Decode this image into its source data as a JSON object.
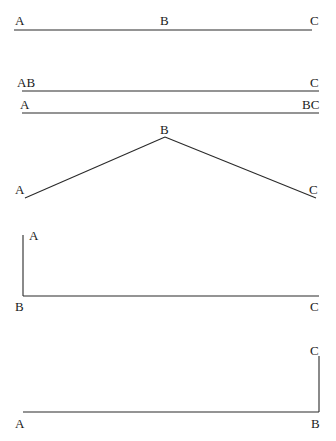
{
  "figures": [
    {
      "id": "straight-line-abc",
      "labels": [
        {
          "text": "A",
          "x": 15,
          "y": 25
        },
        {
          "text": "B",
          "x": 160,
          "y": 25
        },
        {
          "text": "C",
          "x": 310,
          "y": 25
        }
      ],
      "segments": [
        [
          14,
          30,
          312,
          30
        ]
      ]
    },
    {
      "id": "line-ab-c",
      "labels": [
        {
          "text": "AB",
          "x": 17,
          "y": 87
        },
        {
          "text": "C",
          "x": 310,
          "y": 87
        }
      ],
      "segments": [
        [
          22,
          91,
          319,
          91
        ]
      ]
    },
    {
      "id": "line-a-bc",
      "labels": [
        {
          "text": "A",
          "x": 20,
          "y": 109
        },
        {
          "text": "BC",
          "x": 302,
          "y": 109
        }
      ],
      "segments": [
        [
          22,
          113,
          319,
          113
        ]
      ]
    },
    {
      "id": "angle-peak-b",
      "labels": [
        {
          "text": "B",
          "x": 160,
          "y": 134
        },
        {
          "text": "A",
          "x": 15,
          "y": 194
        },
        {
          "text": "C",
          "x": 309,
          "y": 194
        }
      ],
      "segments": [
        [
          25,
          198,
          165,
          137
        ],
        [
          165,
          137,
          316,
          198
        ]
      ]
    },
    {
      "id": "right-angle-at-b-left",
      "labels": [
        {
          "text": "A",
          "x": 29,
          "y": 240
        },
        {
          "text": "B",
          "x": 15,
          "y": 311
        },
        {
          "text": "C",
          "x": 310,
          "y": 311
        }
      ],
      "segments": [
        [
          23,
          235,
          23,
          296
        ],
        [
          23,
          296,
          319,
          296
        ]
      ]
    },
    {
      "id": "right-angle-at-b-right",
      "labels": [
        {
          "text": "C",
          "x": 310,
          "y": 355
        },
        {
          "text": "A",
          "x": 15,
          "y": 428
        },
        {
          "text": "B",
          "x": 311,
          "y": 428
        }
      ],
      "segments": [
        [
          23,
          412,
          319,
          412
        ],
        [
          319,
          356,
          319,
          412
        ]
      ]
    }
  ],
  "colors": {
    "line": "#2a2a2a",
    "text": "#1a1a1a",
    "background": "#ffffff"
  }
}
